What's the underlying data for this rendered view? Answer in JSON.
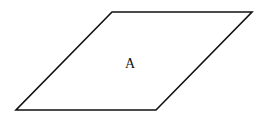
{
  "diagram": {
    "shape": "parallelogram",
    "label": "A",
    "stroke_color": "#111111",
    "background_color": "#ffffff"
  }
}
